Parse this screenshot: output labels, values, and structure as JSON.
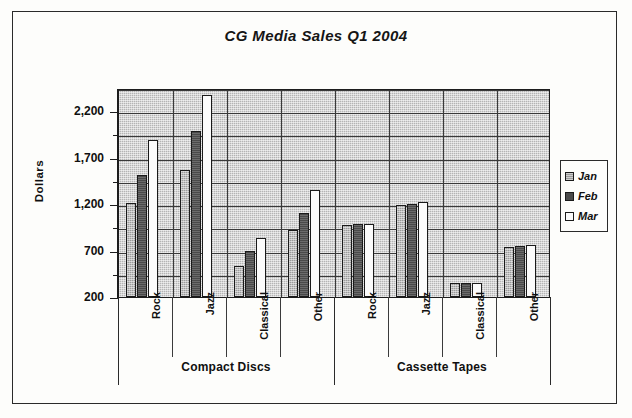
{
  "figure": {
    "title": "CG Media Sales Q1 2004"
  },
  "legend": {
    "position": "right",
    "entries": [
      {
        "label": "Jan",
        "swatch": "medium-gray-hatch"
      },
      {
        "label": "Feb",
        "swatch": "dark-gray"
      },
      {
        "label": "Mar",
        "swatch": "white"
      }
    ]
  },
  "axes": {
    "ylabel": "Dollars",
    "yticks": [
      "200",
      "700",
      "1,200",
      "1,700",
      "2,200"
    ],
    "ymin": 200,
    "ymax": 2450,
    "grid": true
  },
  "groups": [
    {
      "label": "Compact Discs"
    },
    {
      "label": "Cassette Tapes"
    }
  ],
  "categories": [
    "Rock",
    "Jazz",
    "Classical",
    "Other",
    "Rock",
    "Jazz",
    "Classical",
    "Other"
  ],
  "chart_data": {
    "type": "bar",
    "title": "CG Media Sales Q1 2004",
    "xlabel": "",
    "ylabel": "Dollars",
    "ylim": [
      200,
      2450
    ],
    "ytick_values": [
      200,
      700,
      1200,
      1700,
      2200
    ],
    "grid": true,
    "legend_position": "right",
    "group_labels": [
      "Compact Discs",
      "Cassette Tapes"
    ],
    "categories": [
      "Compact Discs - Rock",
      "Compact Discs - Jazz",
      "Compact Discs - Classical",
      "Compact Discs - Other",
      "Cassette Tapes - Rock",
      "Cassette Tapes - Jazz",
      "Cassette Tapes - Classical",
      "Cassette Tapes - Other"
    ],
    "series": [
      {
        "name": "Jan",
        "values": [
          1210,
          1570,
          530,
          920,
          980,
          1190,
          350,
          740
        ]
      },
      {
        "name": "Feb",
        "values": [
          1510,
          1990,
          700,
          1110,
          990,
          1200,
          350,
          750
        ]
      },
      {
        "name": "Mar",
        "values": [
          1890,
          2380,
          840,
          1350,
          990,
          1220,
          350,
          760
        ]
      }
    ]
  }
}
